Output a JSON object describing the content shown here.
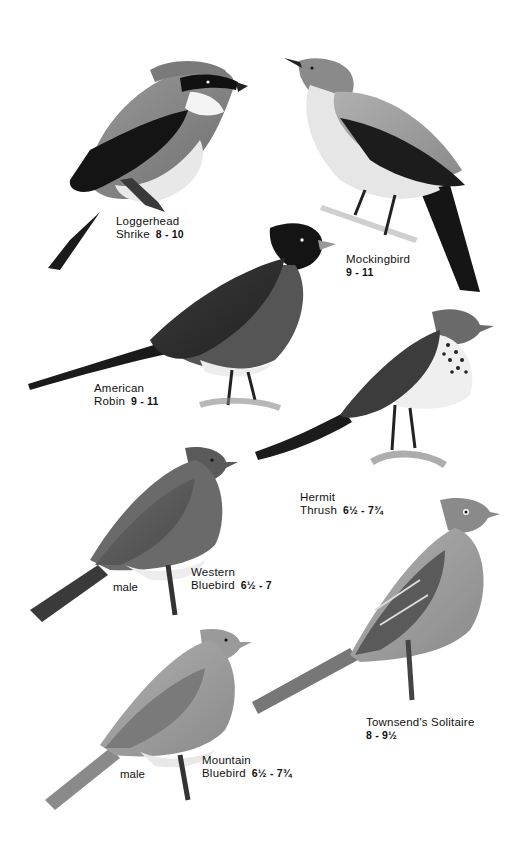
{
  "plate": {
    "background": "#ffffff",
    "ink": "#111111",
    "birds": [
      {
        "id": "loggerhead-shrike",
        "name_lines": [
          "Loggerhead",
          "Shrike"
        ],
        "size": "8 - 10",
        "sex": ""
      },
      {
        "id": "mockingbird",
        "name_lines": [
          "Mockingbird"
        ],
        "size": "9 - 11",
        "sex": ""
      },
      {
        "id": "american-robin",
        "name_lines": [
          "American",
          "Robin"
        ],
        "size": "9 - 11",
        "sex": ""
      },
      {
        "id": "hermit-thrush",
        "name_lines": [
          "Hermit",
          "Thrush"
        ],
        "size": "6½ - 7¾",
        "sex": ""
      },
      {
        "id": "western-bluebird",
        "name_lines": [
          "Western",
          "Bluebird"
        ],
        "size": "6½ - 7",
        "sex": "male"
      },
      {
        "id": "townsends-solitaire",
        "name_lines": [
          "Townsend's Solitaire"
        ],
        "size": "8 - 9½",
        "sex": ""
      },
      {
        "id": "mountain-bluebird",
        "name_lines": [
          "Mountain",
          "Bluebird"
        ],
        "size": "6½ - 7¾",
        "sex": "male"
      }
    ]
  }
}
